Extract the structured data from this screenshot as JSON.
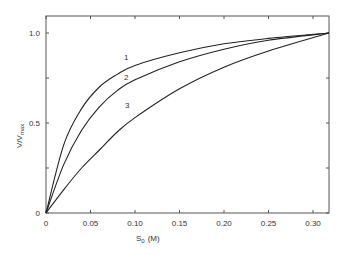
{
  "chart_data": {
    "type": "line",
    "title": "",
    "xlabel": "S0 (M)",
    "ylabel": "V/Vmax",
    "xlim": [
      0,
      0.318
    ],
    "ylim": [
      0,
      1.1
    ],
    "grid": false,
    "legend": "inline curve labels",
    "xticks": [
      "0",
      "0.05",
      "0.10",
      "0.15",
      "0.20",
      "0.25",
      "0.30"
    ],
    "yticks": [
      "0",
      "0.5",
      "1.0"
    ],
    "series": [
      {
        "name": "1",
        "x": [
          0,
          0.02,
          0.04,
          0.06,
          0.08,
          0.1,
          0.15,
          0.2,
          0.25,
          0.318
        ],
        "y": [
          0,
          0.38,
          0.58,
          0.7,
          0.77,
          0.82,
          0.89,
          0.94,
          0.97,
          1.0
        ]
      },
      {
        "name": "2",
        "x": [
          0,
          0.02,
          0.04,
          0.06,
          0.08,
          0.1,
          0.15,
          0.2,
          0.25,
          0.318
        ],
        "y": [
          0,
          0.27,
          0.46,
          0.59,
          0.68,
          0.74,
          0.84,
          0.91,
          0.96,
          1.0
        ]
      },
      {
        "name": "3",
        "x": [
          0,
          0.02,
          0.04,
          0.06,
          0.08,
          0.1,
          0.15,
          0.2,
          0.25,
          0.318
        ],
        "y": [
          0,
          0.13,
          0.25,
          0.35,
          0.45,
          0.53,
          0.69,
          0.81,
          0.9,
          1.0
        ]
      }
    ]
  },
  "labels": {
    "xlabel_main": "S",
    "xlabel_sub": "0",
    "xlabel_unit": "(M)",
    "ylabel_main": "V/V",
    "ylabel_sub": "max",
    "curve1": "1",
    "curve2": "2",
    "curve3": "3"
  },
  "ticks": {
    "x": [
      "0",
      "0.05",
      "0.10",
      "0.15",
      "0.20",
      "0.25",
      "0.30"
    ],
    "y0": "0",
    "y05": "0.5",
    "y10": "1.0"
  }
}
